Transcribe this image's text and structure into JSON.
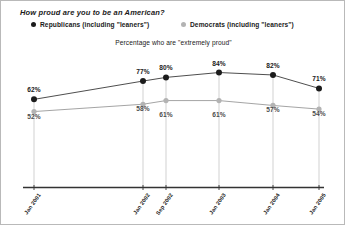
{
  "chart_data": {
    "type": "line",
    "title": "How proud are you to be an American?",
    "subtitle": "Percentage who are \"extremely proud\"",
    "xlabel": "",
    "ylabel": "",
    "ylim": [
      0,
      100
    ],
    "grid": "vertical-dropline",
    "legend_position": "top",
    "categories": [
      "Jan 2001",
      "Jan 2002",
      "Sep 2002",
      "Jan 2003",
      "Jan 2004",
      "Jan 2005"
    ],
    "series": [
      {
        "name": "Republicans (including \"leaners\")",
        "color": "#1c1c1c",
        "values": [
          62,
          77,
          80,
          84,
          82,
          71
        ],
        "labels": [
          "62%",
          "77%",
          "80%",
          "84%",
          "82%",
          "71%"
        ]
      },
      {
        "name": "Democrats (including \"leaners\")",
        "color": "#b3b3b3",
        "values": [
          52,
          58,
          61,
          61,
          57,
          54
        ],
        "labels": [
          "52%",
          "58%",
          "61%",
          "61%",
          "57%",
          "54%"
        ]
      }
    ]
  },
  "legend": {
    "republicans": "Republicans (including \"leaners\")",
    "democrats": "Democrats (including \"leaners\")"
  },
  "colors": {
    "republican": "#1c1c1c",
    "democrat": "#b3b3b3",
    "axis": "#333333",
    "gridline": "#cccccc",
    "border": "#b9b9b9"
  }
}
